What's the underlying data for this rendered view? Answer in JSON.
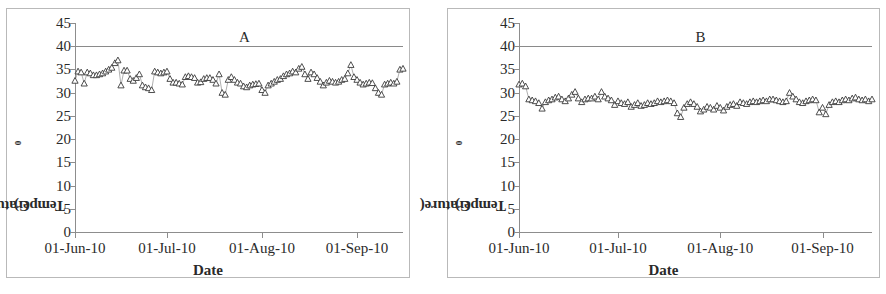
{
  "figure": {
    "panels": [
      {
        "tag": "A",
        "axis": {
          "ylabel_text": "Temperature(",
          "ylabel_sup": "0",
          "ylabel_tail": "C)",
          "xlabel": "Date",
          "yticks": [
            0,
            5,
            10,
            15,
            20,
            25,
            30,
            35,
            40,
            45
          ],
          "xticks": [
            "01-Jun-10",
            "01-Jul-10",
            "01-Aug-10",
            "01-Sep-10"
          ]
        }
      },
      {
        "tag": "B",
        "axis": {
          "ylabel_text": "Temperature(",
          "ylabel_sup": "0",
          "ylabel_tail": "C)",
          "xlabel": "Date",
          "yticks": [
            0,
            5,
            10,
            15,
            20,
            25,
            30,
            35,
            40,
            45
          ],
          "xticks": [
            "01-Jun-10",
            "01-Jul-10",
            "01-Aug-10",
            "01-Sep-10"
          ]
        }
      }
    ]
  },
  "chart_data": [
    {
      "type": "line",
      "title": "A",
      "xlabel": "Date",
      "ylabel": "Temperature(0C)",
      "ylim": [
        0,
        45
      ],
      "ytick_step": 5,
      "grid": false,
      "legend": "none",
      "marker": "open-triangle",
      "reference_line": {
        "y": 40,
        "color": "#8a8a8a"
      },
      "xtick_labels": [
        "01-Jun-10",
        "01-Jul-10",
        "01-Aug-10",
        "01-Sep-10"
      ],
      "xtick_days": [
        0,
        30,
        61,
        92
      ],
      "x_range_days": [
        0,
        107
      ],
      "x": [
        0,
        1,
        2,
        3,
        4,
        5,
        6,
        7,
        8,
        9,
        10,
        11,
        12,
        13,
        14,
        15,
        16,
        17,
        18,
        19,
        20,
        21,
        22,
        23,
        24,
        25,
        26,
        27,
        28,
        29,
        30,
        31,
        32,
        33,
        34,
        35,
        36,
        37,
        38,
        39,
        40,
        41,
        42,
        43,
        44,
        45,
        46,
        47,
        48,
        49,
        50,
        51,
        52,
        53,
        54,
        55,
        56,
        57,
        58,
        59,
        60,
        61,
        62,
        63,
        64,
        65,
        66,
        67,
        68,
        69,
        70,
        71,
        72,
        73,
        74,
        75,
        76,
        77,
        78,
        79,
        80,
        81,
        82,
        83,
        84,
        85,
        86,
        87,
        88,
        89,
        90,
        91,
        92,
        93,
        94,
        95,
        96,
        97,
        98,
        99,
        100,
        101,
        102,
        103,
        104,
        105,
        106,
        107
      ],
      "values": [
        32.6,
        34.6,
        34.4,
        32.0,
        34.4,
        34.2,
        33.8,
        33.8,
        34.0,
        34.2,
        34.6,
        35.0,
        35.4,
        36.4,
        37.0,
        31.6,
        34.8,
        34.8,
        33.0,
        32.6,
        33.2,
        34.0,
        31.6,
        31.2,
        31.0,
        30.6,
        34.6,
        34.4,
        34.2,
        34.4,
        34.6,
        33.0,
        32.2,
        32.2,
        32.0,
        31.8,
        33.4,
        33.6,
        33.4,
        33.2,
        32.2,
        32.3,
        33.0,
        33.2,
        33.2,
        32.8,
        32.0,
        34.0,
        30.0,
        29.6,
        32.8,
        33.4,
        32.8,
        32.2,
        32.0,
        31.4,
        31.2,
        31.6,
        31.8,
        31.9,
        32.0,
        30.6,
        30.0,
        31.6,
        32.0,
        32.4,
        32.8,
        33.0,
        33.6,
        34.0,
        34.2,
        34.6,
        34.4,
        35.2,
        35.6,
        34.0,
        33.0,
        34.4,
        34.0,
        33.2,
        32.4,
        31.6,
        32.2,
        32.6,
        32.4,
        32.2,
        32.4,
        32.8,
        33.0,
        34.2,
        36.0,
        33.4,
        32.8,
        32.2,
        31.8,
        32.0,
        32.2,
        32.1,
        31.0,
        30.0,
        29.6,
        31.8,
        32.0,
        32.2,
        32.0,
        32.4,
        35.0,
        35.2,
        34.6
      ],
      "series_min": 29.6,
      "series_max": 37.0
    },
    {
      "type": "line",
      "title": "B",
      "xlabel": "Date",
      "ylabel": "Temperature(0C)",
      "ylim": [
        0,
        45
      ],
      "ytick_step": 5,
      "grid": false,
      "legend": "none",
      "marker": "open-triangle",
      "reference_line": {
        "y": 40,
        "color": "#8a8a8a"
      },
      "xtick_labels": [
        "01-Jun-10",
        "01-Jul-10",
        "01-Aug-10",
        "01-Sep-10"
      ],
      "xtick_days": [
        0,
        30,
        61,
        92
      ],
      "x_range_days": [
        0,
        107
      ],
      "x": [
        0,
        1,
        2,
        3,
        4,
        5,
        6,
        7,
        8,
        9,
        10,
        11,
        12,
        13,
        14,
        15,
        16,
        17,
        18,
        19,
        20,
        21,
        22,
        23,
        24,
        25,
        26,
        27,
        28,
        29,
        30,
        31,
        32,
        33,
        34,
        35,
        36,
        37,
        38,
        39,
        40,
        41,
        42,
        43,
        44,
        45,
        46,
        47,
        48,
        49,
        50,
        51,
        52,
        53,
        54,
        55,
        56,
        57,
        58,
        59,
        60,
        61,
        62,
        63,
        64,
        65,
        66,
        67,
        68,
        69,
        70,
        71,
        72,
        73,
        74,
        75,
        76,
        77,
        78,
        79,
        80,
        81,
        82,
        83,
        84,
        85,
        86,
        87,
        88,
        89,
        90,
        91,
        92,
        93,
        94,
        95,
        96,
        97,
        98,
        99,
        100,
        101,
        102,
        103,
        104,
        105,
        106,
        107
      ],
      "values": [
        31.8,
        32.0,
        31.4,
        28.6,
        28.4,
        28.2,
        27.8,
        26.6,
        28.0,
        28.4,
        28.6,
        29.0,
        29.2,
        28.6,
        28.2,
        28.8,
        29.6,
        30.2,
        28.8,
        28.0,
        28.6,
        28.8,
        28.8,
        29.2,
        28.6,
        30.2,
        29.2,
        28.8,
        28.4,
        27.4,
        28.2,
        27.8,
        27.6,
        28.0,
        27.0,
        27.4,
        27.8,
        27.2,
        27.4,
        27.8,
        27.6,
        27.8,
        28.2,
        28.0,
        28.2,
        28.4,
        28.2,
        27.8,
        25.6,
        24.8,
        26.8,
        27.6,
        28.0,
        27.6,
        27.0,
        26.0,
        26.4,
        27.0,
        26.8,
        26.4,
        27.2,
        26.8,
        26.2,
        27.0,
        27.4,
        27.6,
        27.2,
        28.0,
        27.8,
        27.6,
        28.0,
        28.2,
        28.0,
        28.2,
        28.4,
        28.2,
        28.6,
        28.6,
        28.4,
        28.2,
        28.0,
        28.2,
        30.0,
        29.2,
        28.6,
        28.0,
        27.8,
        28.2,
        28.4,
        28.6,
        28.4,
        25.8,
        26.8,
        25.4,
        27.4,
        28.0,
        28.2,
        28.0,
        28.4,
        28.6,
        28.4,
        28.8,
        29.0,
        28.6,
        28.4,
        28.6,
        28.2,
        28.6
      ],
      "series_min": 24.8,
      "series_max": 32.0
    }
  ]
}
